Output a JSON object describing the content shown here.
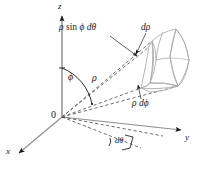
{
  "figure": {
    "type": "spherical-coordinates-volume-element",
    "background_color": "#ffffff",
    "ink_color": "#1a1a1a",
    "axis_color": "#8c8c8c",
    "wedge_color": "#b0b0b0",
    "dashed_color": "#4d4d4d"
  },
  "axes": {
    "z_label": "z",
    "x_label": "x",
    "y_label": "y",
    "origin_label": "0"
  },
  "labels": {
    "arc_length_theta": "ρ sin ϕ dθ",
    "radial_thickness": "dρ",
    "radius": "ρ",
    "polar_angle": "ϕ",
    "arc_length_phi": "ρ dϕ",
    "azimuth_increment": "dθ"
  },
  "label_parts": {
    "rho_sin": {
      "rho": "ρ",
      "sin": "sin",
      "phi": "ϕ",
      "dtheta": "dθ"
    },
    "d_rho": {
      "d": "d",
      "rho": "ρ"
    },
    "rho_dphi": {
      "rho": "ρ",
      "d": "d",
      "phi": "ϕ"
    },
    "d_theta": {
      "d": "d",
      "theta": "θ"
    }
  },
  "geometry": {
    "origin": {
      "x": 62,
      "y": 117
    },
    "z_axis_tip": {
      "x": 62,
      "y": 13
    },
    "x_axis_tip": {
      "x": 14,
      "y": 157
    },
    "y_axis_tip": {
      "x": 186,
      "y": 131
    }
  }
}
